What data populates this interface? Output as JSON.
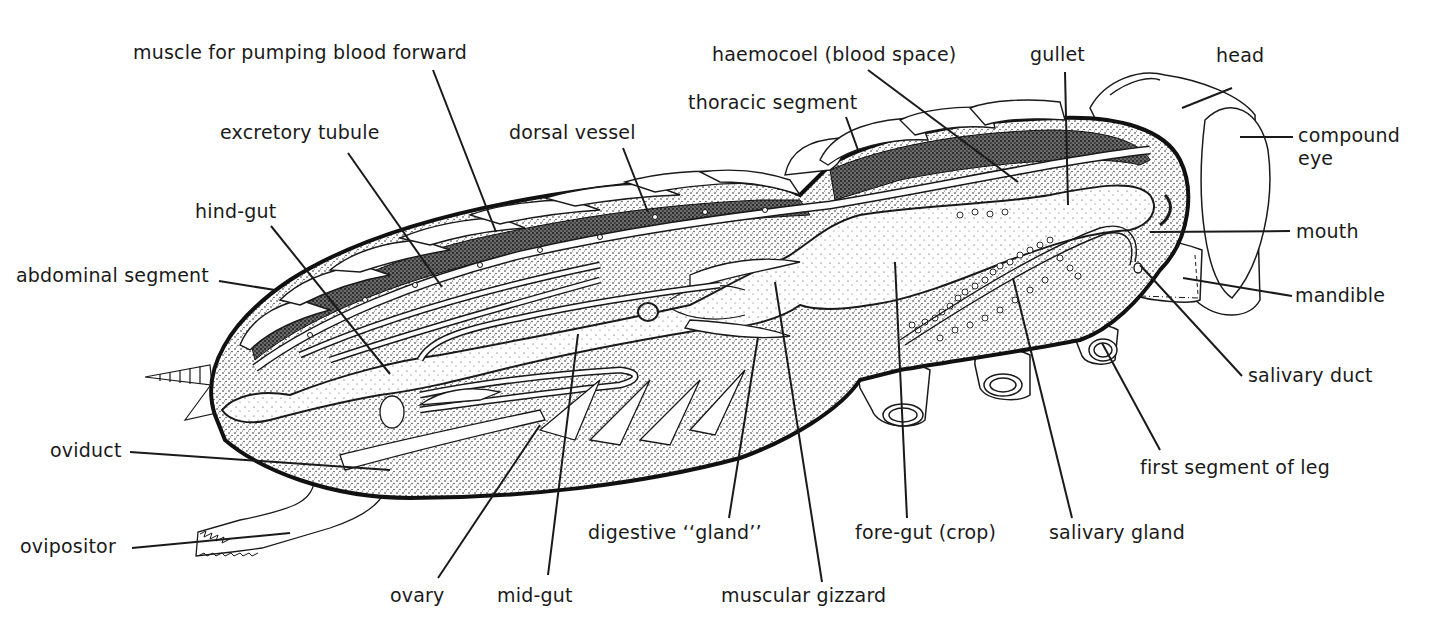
{
  "figure": {
    "colors": {
      "ink": "#1a1a1a",
      "background": "#ffffff",
      "stipple": "#8a8a8a"
    }
  },
  "labels": {
    "muscle_for_pumping_blood_forward": "muscle for pumping blood forward",
    "excretory_tubule": "excretory tubule",
    "dorsal_vessel": "dorsal vessel",
    "hind_gut": "hind-gut",
    "abdominal_segment": "abdominal segment",
    "thoracic_segment": "thoracic segment",
    "haemocoel": "haemocoel (blood space)",
    "gullet": "gullet",
    "head": "head",
    "compound_eye_line1": "compound",
    "compound_eye_line2": "eye",
    "mouth": "mouth",
    "mandible": "mandible",
    "salivary_duct": "salivary duct",
    "first_segment_of_leg": "first segment of leg",
    "oviduct": "oviduct",
    "ovipositor": "ovipositor",
    "ovary": "ovary",
    "mid_gut": "mid-gut",
    "digestive_gland": "digestive ‘‘gland’’",
    "muscular_gizzard": "muscular gizzard",
    "fore_gut": "fore-gut (crop)",
    "salivary_gland": "salivary gland"
  }
}
